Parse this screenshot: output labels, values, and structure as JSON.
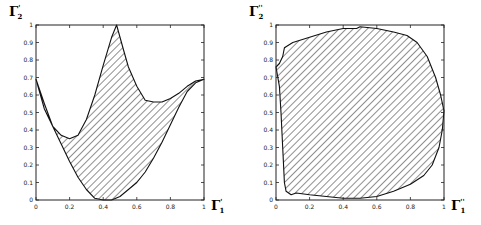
{
  "chart_data": [
    {
      "type": "area",
      "title": "",
      "xlabel": "Γ'1",
      "ylabel": "Γ'2",
      "xlim": [
        0,
        1
      ],
      "ylim": [
        0,
        1
      ],
      "xticks": [
        "0",
        "0.2",
        "0.4",
        "0.6",
        "0.8",
        "1"
      ],
      "yticks": [
        "0",
        "0.1",
        "0.2",
        "0.3",
        "0.4",
        "0.5",
        "0.6",
        "0.7",
        "0.8",
        "0.9",
        "1"
      ],
      "grid": false,
      "fill": "diagonal-hatch",
      "series": [
        {
          "name": "upper boundary",
          "x": [
            0,
            0.05,
            0.1,
            0.15,
            0.2,
            0.25,
            0.3,
            0.35,
            0.4,
            0.45,
            0.48,
            0.52,
            0.55,
            0.6,
            0.65,
            0.7,
            0.75,
            0.8,
            0.85,
            0.9,
            0.95,
            1.0
          ],
          "y": [
            0.69,
            0.52,
            0.42,
            0.37,
            0.35,
            0.37,
            0.46,
            0.6,
            0.77,
            0.93,
            1.0,
            0.86,
            0.76,
            0.65,
            0.57,
            0.56,
            0.56,
            0.58,
            0.61,
            0.65,
            0.68,
            0.69
          ]
        },
        {
          "name": "lower boundary",
          "x": [
            0,
            0.05,
            0.1,
            0.15,
            0.2,
            0.25,
            0.3,
            0.35,
            0.4,
            0.45,
            0.5,
            0.55,
            0.6,
            0.65,
            0.7,
            0.75,
            0.8,
            0.85,
            0.9,
            0.95,
            1.0
          ],
          "y": [
            0.69,
            0.55,
            0.42,
            0.32,
            0.22,
            0.13,
            0.06,
            0.01,
            0.0,
            0.0,
            0.02,
            0.06,
            0.1,
            0.16,
            0.24,
            0.33,
            0.43,
            0.53,
            0.62,
            0.67,
            0.69
          ]
        }
      ]
    },
    {
      "type": "area",
      "title": "",
      "xlabel": "Γ''1",
      "ylabel": "Γ''2",
      "xlim": [
        0,
        1
      ],
      "ylim": [
        0,
        1
      ],
      "xticks": [
        "0",
        "0.2",
        "0.4",
        "0.6",
        "0.8",
        "1"
      ],
      "yticks": [
        "0",
        "0.1",
        "0.2",
        "0.3",
        "0.4",
        "0.5",
        "0.6",
        "0.7",
        "0.8",
        "0.9",
        "1"
      ],
      "grid": false,
      "fill": "diagonal-hatch",
      "series": [
        {
          "name": "region boundary",
          "x": [
            0.0,
            0.02,
            0.04,
            0.05,
            0.1,
            0.2,
            0.3,
            0.4,
            0.48,
            0.5,
            0.6,
            0.7,
            0.78,
            0.84,
            0.9,
            0.95,
            0.98,
            1.0,
            0.99,
            0.97,
            0.93,
            0.88,
            0.8,
            0.7,
            0.6,
            0.5,
            0.4,
            0.3,
            0.2,
            0.12,
            0.09,
            0.06,
            0.05,
            0.04,
            0.03,
            0.02,
            0.0
          ],
          "y": [
            0.76,
            0.78,
            0.82,
            0.87,
            0.9,
            0.93,
            0.96,
            0.98,
            0.98,
            0.99,
            0.98,
            0.96,
            0.94,
            0.9,
            0.82,
            0.7,
            0.6,
            0.51,
            0.4,
            0.3,
            0.2,
            0.14,
            0.09,
            0.05,
            0.02,
            0.01,
            0.01,
            0.02,
            0.03,
            0.04,
            0.03,
            0.05,
            0.1,
            0.3,
            0.5,
            0.65,
            0.76
          ]
        }
      ]
    }
  ],
  "panels": [
    {
      "ylabel_main": "Γ",
      "ylabel_sup": "'",
      "ylabel_sub": "2",
      "xlabel_main": "Γ",
      "xlabel_sup": "'",
      "xlabel_sub": "1"
    },
    {
      "ylabel_main": "Γ",
      "ylabel_sup": "''",
      "ylabel_sub": "2",
      "xlabel_main": "Γ",
      "xlabel_sup": "''",
      "xlabel_sub": "1"
    }
  ],
  "ticks": {
    "x": [
      "0",
      "0.2",
      "0.4",
      "0.6",
      "0.8",
      "1"
    ],
    "y": [
      "0",
      "0.1",
      "0.2",
      "0.3",
      "0.4",
      "0.5",
      "0.6",
      "0.7",
      "0.8",
      "0.9",
      "1"
    ]
  }
}
